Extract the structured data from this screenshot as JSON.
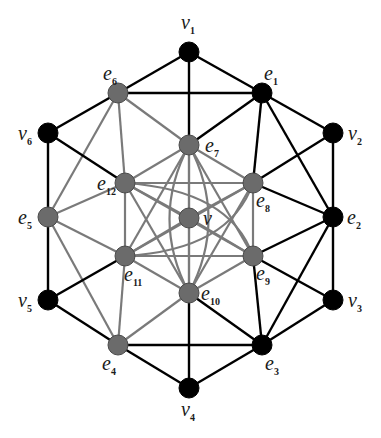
{
  "diagram": {
    "title": "",
    "colors": {
      "black_node": "#000000",
      "gray_node": "#6b6b6b",
      "gray_node_stroke": "#4a4a4a",
      "black_edge": "#000000",
      "gray_edge": "#7a7a7a",
      "background": "#ffffff"
    },
    "nodes": [
      {
        "id": "v1",
        "base": "v",
        "sub": "1",
        "x": 189,
        "y": 52,
        "color": "black",
        "lx": 181,
        "ly": 29,
        "anchor": "start"
      },
      {
        "id": "v2",
        "base": "v",
        "sub": "2",
        "x": 333,
        "y": 133,
        "color": "black",
        "lx": 348,
        "ly": 140,
        "anchor": "start"
      },
      {
        "id": "v3",
        "base": "v",
        "sub": "3",
        "x": 333,
        "y": 300,
        "color": "black",
        "lx": 348,
        "ly": 307,
        "anchor": "start"
      },
      {
        "id": "v4",
        "base": "v",
        "sub": "4",
        "x": 189,
        "y": 388,
        "color": "black",
        "lx": 181,
        "ly": 416,
        "anchor": "start"
      },
      {
        "id": "v5",
        "base": "v",
        "sub": "5",
        "x": 48,
        "y": 300,
        "color": "black",
        "lx": 18,
        "ly": 307,
        "anchor": "start"
      },
      {
        "id": "v6",
        "base": "v",
        "sub": "6",
        "x": 48,
        "y": 133,
        "color": "black",
        "lx": 18,
        "ly": 140,
        "anchor": "start"
      },
      {
        "id": "e1",
        "base": "e",
        "sub": "1",
        "x": 262,
        "y": 93,
        "color": "black",
        "lx": 264,
        "ly": 80,
        "anchor": "start"
      },
      {
        "id": "e2",
        "base": "e",
        "sub": "2",
        "x": 333,
        "y": 217,
        "color": "black",
        "lx": 347,
        "ly": 224,
        "anchor": "start"
      },
      {
        "id": "e3",
        "base": "e",
        "sub": "3",
        "x": 262,
        "y": 345,
        "color": "black",
        "lx": 265,
        "ly": 370,
        "anchor": "start"
      },
      {
        "id": "e4",
        "base": "e",
        "sub": "4",
        "x": 118,
        "y": 345,
        "color": "gray",
        "lx": 102,
        "ly": 370,
        "anchor": "start"
      },
      {
        "id": "e5",
        "base": "e",
        "sub": "5",
        "x": 48,
        "y": 217,
        "color": "gray",
        "lx": 18,
        "ly": 224,
        "anchor": "start"
      },
      {
        "id": "e6",
        "base": "e",
        "sub": "6",
        "x": 118,
        "y": 93,
        "color": "gray",
        "lx": 103,
        "ly": 80,
        "anchor": "start"
      },
      {
        "id": "e7",
        "base": "e",
        "sub": "7",
        "x": 189,
        "y": 145,
        "color": "gray",
        "lx": 205,
        "ly": 152,
        "anchor": "start"
      },
      {
        "id": "e8",
        "base": "e",
        "sub": "8",
        "x": 253,
        "y": 183,
        "color": "gray",
        "lx": 256,
        "ly": 207,
        "anchor": "start"
      },
      {
        "id": "e9",
        "base": "e",
        "sub": "9",
        "x": 253,
        "y": 256,
        "color": "gray",
        "lx": 256,
        "ly": 280,
        "anchor": "start"
      },
      {
        "id": "e10",
        "base": "e",
        "sub": "10",
        "x": 189,
        "y": 293,
        "color": "gray",
        "lx": 201,
        "ly": 300,
        "anchor": "start"
      },
      {
        "id": "e11",
        "base": "e",
        "sub": "11",
        "x": 125,
        "y": 256,
        "color": "gray",
        "lx": 124,
        "ly": 281,
        "anchor": "start"
      },
      {
        "id": "e12",
        "base": "e",
        "sub": "12",
        "x": 125,
        "y": 183,
        "color": "gray",
        "lx": 97,
        "ly": 190,
        "anchor": "start"
      },
      {
        "id": "v",
        "base": "v",
        "sub": "",
        "x": 189,
        "y": 218,
        "color": "gray",
        "lx": 203,
        "ly": 225,
        "anchor": "start"
      }
    ],
    "edges_black": [
      [
        "v1",
        "e6"
      ],
      [
        "v1",
        "e1"
      ],
      [
        "v1",
        "e7"
      ],
      [
        "e6",
        "e1"
      ],
      [
        "e1",
        "e7"
      ],
      [
        "e1",
        "v2"
      ],
      [
        "e1",
        "e8"
      ],
      [
        "e1",
        "e2"
      ],
      [
        "v2",
        "e8"
      ],
      [
        "v2",
        "e2"
      ],
      [
        "e2",
        "e8"
      ],
      [
        "e2",
        "e9"
      ],
      [
        "e2",
        "v3"
      ],
      [
        "e2",
        "e3"
      ],
      [
        "v3",
        "e9"
      ],
      [
        "v3",
        "e3"
      ],
      [
        "e3",
        "e9"
      ],
      [
        "e3",
        "e10"
      ],
      [
        "e3",
        "v4"
      ],
      [
        "e3",
        "e4"
      ],
      [
        "v4",
        "e4"
      ],
      [
        "v4",
        "e10"
      ],
      [
        "e4",
        "v5"
      ],
      [
        "v5",
        "e11"
      ],
      [
        "v5",
        "e5"
      ],
      [
        "e5",
        "v6"
      ],
      [
        "v6",
        "e6"
      ],
      [
        "v6",
        "e12"
      ]
    ],
    "edges_gray": [
      [
        "e6",
        "e7"
      ],
      [
        "e6",
        "e12"
      ],
      [
        "e6",
        "e5"
      ],
      [
        "e5",
        "e12"
      ],
      [
        "e5",
        "e11"
      ],
      [
        "e5",
        "e4"
      ],
      [
        "e4",
        "e11"
      ],
      [
        "e4",
        "e10"
      ],
      [
        "e7",
        "e12"
      ],
      [
        "e7",
        "e8"
      ],
      [
        "e7",
        "v"
      ],
      [
        "e7",
        "e11"
      ],
      [
        "e7",
        "e9"
      ],
      [
        "e12",
        "e8"
      ],
      [
        "e12",
        "e11"
      ],
      [
        "e12",
        "v"
      ],
      [
        "e12",
        "e10"
      ],
      [
        "e8",
        "e9"
      ],
      [
        "e8",
        "v"
      ],
      [
        "e8",
        "e10"
      ],
      [
        "e8",
        "e11"
      ],
      [
        "e9",
        "e11"
      ],
      [
        "e9",
        "v"
      ],
      [
        "e9",
        "e12"
      ],
      [
        "e9",
        "e10"
      ],
      [
        "e11",
        "v"
      ],
      [
        "e11",
        "e10"
      ],
      [
        "v",
        "e10"
      ],
      [
        "e10",
        "e7"
      ]
    ],
    "edges_gray_curved": [
      {
        "from": "e7",
        "to": "e10",
        "cx": 150,
        "cy": 219
      },
      {
        "from": "e7",
        "to": "e10",
        "cx": 228,
        "cy": 219
      },
      {
        "from": "e12",
        "to": "e9",
        "cx": 230,
        "cy": 190
      },
      {
        "from": "e11",
        "to": "e8",
        "cx": 230,
        "cy": 250
      }
    ]
  }
}
